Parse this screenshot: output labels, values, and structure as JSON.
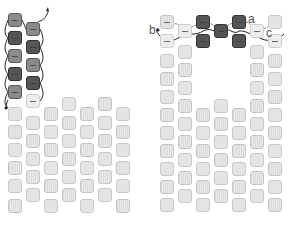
{
  "diagram": {
    "labels": {
      "a": "a",
      "b": "b",
      "c": "c"
    },
    "colors": {
      "dark": "#555555",
      "mid": "#8a8a8a",
      "light": "#e4e4e4",
      "thread": "#222222"
    },
    "left_panel": {
      "columns": 7,
      "highlighted_beads": 9,
      "note": "Working beads stacked in first two columns with thread path"
    },
    "right_panel": {
      "columns": 7,
      "highlighted_beads": 6,
      "points": [
        "a",
        "b",
        "c"
      ]
    }
  }
}
